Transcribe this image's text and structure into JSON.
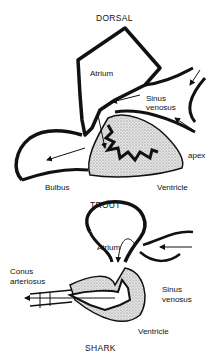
{
  "trout": {
    "orientation": "DORSAL",
    "title": "TROUT",
    "labels": {
      "atrium": "Atrium",
      "sinus_line1": "Sinus",
      "sinus_line2": "venosus",
      "apex": "apex",
      "bulbus": "Bulbus",
      "ventricle": "Ventricle"
    }
  },
  "shark": {
    "title": "SHARK",
    "labels": {
      "atrium": "Atrium",
      "conus_line1": "Conus",
      "conus_line2": "arteriosus",
      "sinus_line1": "Sinus",
      "sinus_line2": "venosus",
      "ventricle": "Ventricle"
    }
  }
}
